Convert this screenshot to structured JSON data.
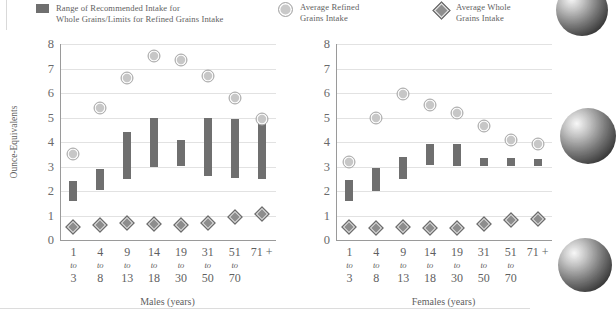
{
  "legend": {
    "items": [
      {
        "name": "range",
        "marker": "bar-swatch",
        "label": "Range of Recommended Intake for\nWhole Grains/Limits for Refined Grains Intake"
      },
      {
        "name": "refined",
        "marker": "circle-swatch",
        "label": "Average Refined\nGrains Intake"
      },
      {
        "name": "whole",
        "marker": "diamond-swatch",
        "label": "Average Whole\nGrains Intake"
      }
    ]
  },
  "colors": {
    "range_bar": "#6f6f6f",
    "refined_marker": "#c7c7c7",
    "whole_marker": "#8d8d8d",
    "gridline": "#e2e2e2",
    "axis": "#9a9a9a",
    "text": "#5f5f5f"
  },
  "chart_data": [
    {
      "type": "bar",
      "id": "males",
      "title": "",
      "xlabel": "Males (years)",
      "ylabel": "Ounce-Equivalents",
      "ylim": [
        0,
        8
      ],
      "yticks": [
        0,
        1,
        2,
        3,
        4,
        5,
        6,
        7,
        8
      ],
      "grid": true,
      "legend_position": "top",
      "categories": [
        "1\nto\n3",
        "4\nto\n8",
        "9\nto\n13",
        "14\nto\n18",
        "19\nto\n30",
        "31\nto\n50",
        "51\nto\n70",
        "71 +"
      ],
      "category_lines": [
        [
          "1",
          "to",
          "3"
        ],
        [
          "4",
          "to",
          "8"
        ],
        [
          "9",
          "to",
          "13"
        ],
        [
          "14",
          "to",
          "18"
        ],
        [
          "19",
          "to",
          "30"
        ],
        [
          "31",
          "to",
          "50"
        ],
        [
          "51",
          "to",
          "70"
        ],
        [
          "71 +",
          "",
          ""
        ]
      ],
      "series": [
        {
          "name": "Range of Recommended Intake for Whole Grains/Limits for Refined Grains Intake",
          "type": "range-bar",
          "low": [
            1.6,
            2.05,
            2.5,
            3.0,
            3.0,
            2.6,
            2.55,
            2.5
          ],
          "high": [
            2.4,
            2.9,
            4.4,
            5.0,
            4.1,
            5.0,
            4.95,
            4.9
          ]
        },
        {
          "name": "Average Refined Grains Intake",
          "type": "marker-circle",
          "values": [
            3.5,
            5.4,
            6.6,
            7.5,
            7.35,
            6.7,
            5.8,
            4.95
          ]
        },
        {
          "name": "Average Whole Grains Intake",
          "type": "marker-diamond",
          "values": [
            0.55,
            0.6,
            0.7,
            0.65,
            0.6,
            0.7,
            0.95,
            1.05
          ]
        }
      ]
    },
    {
      "type": "bar",
      "id": "females",
      "title": "",
      "xlabel": "Females (years)",
      "ylabel": "",
      "ylim": [
        0,
        8
      ],
      "yticks": [
        0,
        1,
        2,
        3,
        4,
        5,
        6,
        7,
        8
      ],
      "grid": true,
      "legend_position": "top",
      "categories": [
        "1\nto\n3",
        "4\nto\n8",
        "9\nto\n13",
        "14\nto\n18",
        "19\nto\n30",
        "31\nto\n50",
        "51\nto\n70",
        "71 +"
      ],
      "category_lines": [
        [
          "1",
          "to",
          "3"
        ],
        [
          "4",
          "to",
          "8"
        ],
        [
          "9",
          "to",
          "13"
        ],
        [
          "14",
          "to",
          "18"
        ],
        [
          "19",
          "to",
          "30"
        ],
        [
          "31",
          "to",
          "50"
        ],
        [
          "51",
          "to",
          "70"
        ],
        [
          "71 +",
          "",
          ""
        ]
      ],
      "series": [
        {
          "name": "Range of Recommended Intake for Whole Grains/Limits for Refined Grains Intake",
          "type": "range-bar",
          "low": [
            1.6,
            2.0,
            2.5,
            3.05,
            3.0,
            3.0,
            3.0,
            3.0
          ],
          "high": [
            2.45,
            2.95,
            3.4,
            3.9,
            3.9,
            3.35,
            3.35,
            3.3
          ]
        },
        {
          "name": "Average Refined Grains Intake",
          "type": "marker-circle",
          "values": [
            3.2,
            5.0,
            5.95,
            5.5,
            5.2,
            4.65,
            4.1,
            3.9
          ]
        },
        {
          "name": "Average Whole Grains Intake",
          "type": "marker-diamond",
          "values": [
            0.55,
            0.5,
            0.55,
            0.5,
            0.5,
            0.65,
            0.8,
            0.85
          ]
        }
      ]
    }
  ]
}
